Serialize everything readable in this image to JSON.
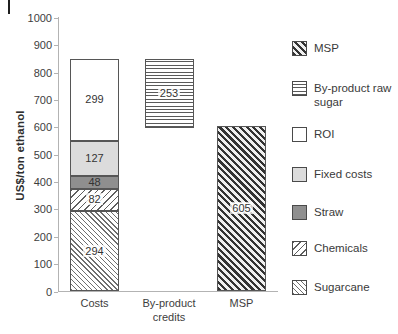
{
  "page": {
    "decoration": {
      "corner_mark": "vertical-bar"
    }
  },
  "chart_data": {
    "type": "bar",
    "stacked": true,
    "title": "",
    "xlabel": "",
    "ylabel": "US$/ton ethanol",
    "ylim": [
      0,
      1000
    ],
    "ytick_interval": 100,
    "yticks": [
      0,
      100,
      200,
      300,
      400,
      500,
      600,
      700,
      800,
      900,
      1000
    ],
    "grid": false,
    "categories": [
      "Costs",
      "By-product credits",
      "MSP"
    ],
    "bars": [
      {
        "category": "Costs",
        "segments": [
          {
            "name": "Sugarcane",
            "value": 294,
            "from": 0,
            "to": 294,
            "pattern": "p-cane",
            "label": "294",
            "halo": true
          },
          {
            "name": "Chemicals",
            "value": 82,
            "from": 294,
            "to": 376,
            "pattern": "p-chem",
            "label": "82",
            "halo": true
          },
          {
            "name": "Straw",
            "value": 48,
            "from": 376,
            "to": 424,
            "pattern": "p-dark",
            "label": "48",
            "halo": false
          },
          {
            "name": "Fixed costs",
            "value": 127,
            "from": 424,
            "to": 551,
            "pattern": "p-light",
            "label": "127",
            "halo": false
          },
          {
            "name": "ROI",
            "value": 299,
            "from": 551,
            "to": 850,
            "pattern": "p-white",
            "label": "299",
            "halo": false
          }
        ]
      },
      {
        "category": "By-product credits",
        "segments": [
          {
            "name": "By-product raw sugar",
            "value": 253,
            "from": 597,
            "to": 850,
            "pattern": "p-hline",
            "label": "253",
            "halo": true
          }
        ]
      },
      {
        "category": "MSP",
        "segments": [
          {
            "name": "MSP",
            "value": 605,
            "from": 0,
            "to": 605,
            "pattern": "p-msp",
            "label": "605",
            "halo": true
          }
        ]
      }
    ],
    "legend": {
      "position": "right",
      "items": [
        {
          "label": "MSP",
          "pattern": "p-msp"
        },
        {
          "label": "By-product raw sugar",
          "pattern": "p-hline"
        },
        {
          "label": "ROI",
          "pattern": "p-white"
        },
        {
          "label": "Fixed costs",
          "pattern": "p-light"
        },
        {
          "label": "Straw",
          "pattern": "p-dark"
        },
        {
          "label": "Chemicals",
          "pattern": "p-chem"
        },
        {
          "label": "Sugarcane",
          "pattern": "p-cane"
        }
      ]
    },
    "colors": {
      "axis": "#b3b3b3",
      "text": "#3d3d3d",
      "segment_border": "#565656",
      "straw_fill": "#8f8f8f",
      "fixed_costs_fill": "#dcdcdc",
      "hatch_line": "#5f5f5f"
    }
  }
}
